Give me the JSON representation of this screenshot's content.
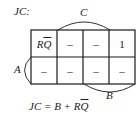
{
  "title": "JC:",
  "labels": {
    "C": "C",
    "A": "A",
    "B": "B"
  },
  "grid": {
    "rows": [
      [
        "RQ̄",
        "–",
        "–",
        "1"
      ],
      [
        "–",
        "–",
        "–",
        "–"
      ]
    ]
  },
  "cells": {
    "r0c0_main": "R",
    "r0c0_bar": "Q",
    "r0c1": "–",
    "r0c2": "–",
    "r0c3": "1",
    "r1c0": "–",
    "r1c1": "–",
    "r1c2": "–",
    "r1c3": "–"
  },
  "equation": {
    "lhs": "JC = B + R",
    "bar": "Q"
  },
  "colors": {
    "line": "#1a1a1a",
    "background": "#ffffff"
  }
}
